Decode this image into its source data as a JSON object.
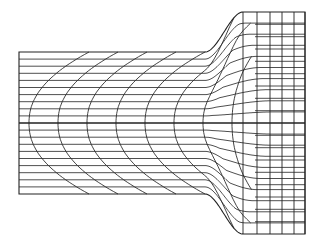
{
  "diagram": {
    "type": "deformed-mesh",
    "line_color": "#222222",
    "background": "#ffffff",
    "geometry": {
      "left_x": 19,
      "center_y": 123,
      "billet_half_height": 71,
      "taper_start_x": 205,
      "taper_end_x": 243,
      "right_x": 305,
      "right_half_height": 111,
      "billet_rows_per_half": 10,
      "right_columns_x": [
        243,
        257,
        270,
        282,
        294,
        305
      ],
      "right_rows_per_half": 9,
      "flowline_count": 6
    }
  }
}
